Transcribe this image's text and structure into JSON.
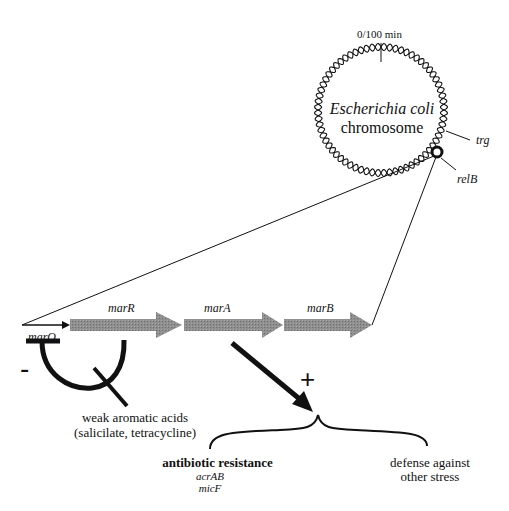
{
  "diagram": {
    "chromosome": {
      "title_line1": "Escherichia coli",
      "title_line2": "chromosome",
      "origin_label": "0/100 min",
      "markers": [
        {
          "label": "trg"
        },
        {
          "label": "relB"
        }
      ]
    },
    "operon": {
      "promoter_label": "marO",
      "genes": [
        {
          "label": "marR"
        },
        {
          "label": "marA"
        },
        {
          "label": "marB"
        }
      ],
      "gene_color": "#8a8a8a"
    },
    "regulation": {
      "repression_sign": "-",
      "activation_sign": "+",
      "inducer_line1": "weak aromatic acids",
      "inducer_line2": "(salicilate, tetracycline)"
    },
    "outcomes": {
      "left_title": "antibiotic resistance",
      "left_genes": [
        "acrAB",
        "micF"
      ],
      "right_line1": "defense against",
      "right_line2": "other stress"
    }
  }
}
